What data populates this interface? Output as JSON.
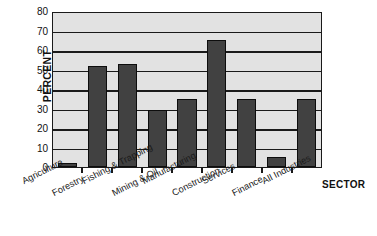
{
  "chart_data": {
    "type": "bar",
    "title": "",
    "xlabel": "SECTOR",
    "ylabel": "PERCENT",
    "categories": [
      "Agriculture",
      "Forestry",
      "Fishing & Trapping",
      "Mining & Oil",
      "Manufacturing",
      "Construction",
      "Services",
      "Finance",
      "All Industries"
    ],
    "values": [
      2,
      52,
      53,
      29,
      35,
      65,
      35,
      5,
      35
    ],
    "ylim": [
      0,
      80
    ],
    "yticks": [
      0,
      10,
      20,
      30,
      40,
      50,
      60,
      70,
      80
    ],
    "ytick_labels": [
      "0",
      "10",
      "20",
      "30",
      "40",
      "50",
      "60",
      "70",
      "80"
    ],
    "grid": true,
    "legend": false,
    "legend_position": "none",
    "bar_color": "#414141",
    "bar_edge_color": "#0d0d0d",
    "plot_background": "#e2e2e2",
    "axis_color": "#1a1a1a",
    "label_rotation_deg": -27
  },
  "axes": {
    "y_title": "PERCENT",
    "x_title": "SECTOR"
  }
}
